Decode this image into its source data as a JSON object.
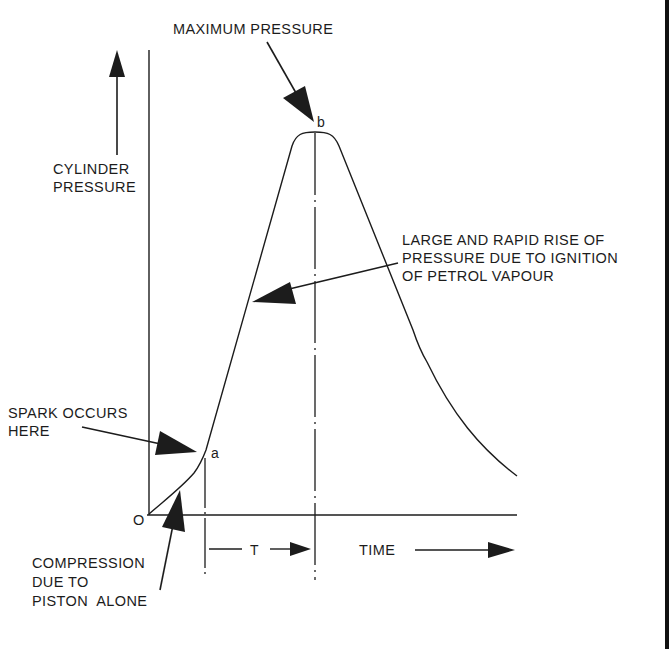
{
  "diagram": {
    "axes": {
      "y_label_line1": "CYLINDER",
      "y_label_line2": "PRESSURE",
      "x_label": "TIME",
      "origin_label": "O"
    },
    "points": {
      "spark_point": "a",
      "peak_point": "b"
    },
    "interval_label": "T",
    "annotations": {
      "max_pressure": "MAXIMUM PRESSURE",
      "rapid_rise_line1": "LARGE AND RAPID RISE OF",
      "rapid_rise_line2": "PRESSURE DUE TO IGNITION",
      "rapid_rise_line3": "OF PETROL VAPOUR",
      "spark_line1": "SPARK OCCURS",
      "spark_line2": "HERE",
      "compression_line1": "COMPRESSION",
      "compression_line2": "DUE TO",
      "compression_line3": "PISTON  ALONE"
    },
    "colors": {
      "ink": "#1c1c1c",
      "background": "#ffffff"
    }
  }
}
